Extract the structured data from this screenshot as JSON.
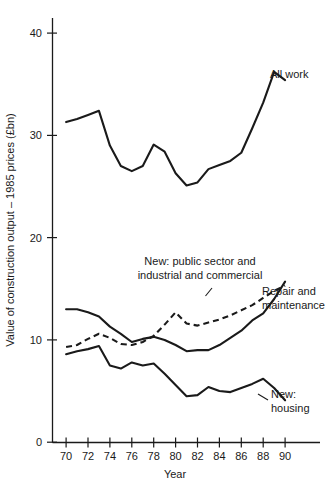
{
  "chart_data": {
    "type": "line",
    "title": "",
    "xlabel": "Year",
    "ylabel": "Value of construction output – 1985 prices (£bn)",
    "xlim": [
      69.2,
      91.0
    ],
    "ylim": [
      0,
      41.5
    ],
    "grid": false,
    "legend_position": "inline-annotations",
    "x_ticks": [
      70,
      72,
      74,
      76,
      78,
      80,
      82,
      84,
      86,
      88,
      90
    ],
    "x_tick_labels": [
      "70",
      "72",
      "74",
      "76",
      "78",
      "80",
      "82",
      "84",
      "86",
      "88",
      "90"
    ],
    "y_ticks": [
      0,
      10,
      20,
      30,
      40
    ],
    "y_tick_labels": [
      "0",
      "10",
      "20",
      "30",
      "40"
    ],
    "x": [
      70,
      71,
      72,
      73,
      74,
      75,
      76,
      77,
      78,
      79,
      80,
      81,
      82,
      83,
      84,
      85,
      86,
      87,
      88,
      89,
      90
    ],
    "series": [
      {
        "name": "All work",
        "style": "solid",
        "label": "All work",
        "values": [
          31.3,
          31.6,
          32.0,
          32.4,
          29.0,
          27.0,
          26.5,
          27.0,
          29.1,
          28.4,
          26.3,
          25.1,
          25.4,
          26.7,
          27.1,
          27.5,
          28.3,
          30.7,
          33.2,
          36.2,
          35.4
        ]
      },
      {
        "name": "Repair and maintenance",
        "style": "solid",
        "label": "Repair and\nmaintenance",
        "label_line1": "Repair and",
        "label_line2": "maintenance",
        "values": [
          13.0,
          13.0,
          12.7,
          12.3,
          11.3,
          10.6,
          9.8,
          10.1,
          10.3,
          10.0,
          9.5,
          8.9,
          9.0,
          9.0,
          9.5,
          10.2,
          10.9,
          11.9,
          12.6,
          14.0,
          15.7
        ]
      },
      {
        "name": "New: public sector and industrial and commercial",
        "style": "dashed",
        "label": "New: public sector and\nindustrial and commercial",
        "label_line1": "New: public sector and",
        "label_line2": "industrial and commercial",
        "values": [
          9.3,
          9.5,
          10.1,
          10.6,
          10.2,
          9.6,
          9.5,
          9.8,
          10.4,
          11.5,
          12.7,
          11.6,
          11.4,
          11.7,
          12.0,
          12.4,
          12.9,
          13.4,
          14.1,
          14.8,
          15.3
        ]
      },
      {
        "name": "New: housing",
        "style": "solid",
        "label": "New:\nhousing",
        "label_line1": "New:",
        "label_line2": "housing",
        "values": [
          8.6,
          8.9,
          9.1,
          9.4,
          7.5,
          7.2,
          7.8,
          7.5,
          7.7,
          6.7,
          5.6,
          4.5,
          4.6,
          5.4,
          5.0,
          4.9,
          5.3,
          5.7,
          6.2,
          5.3,
          4.1
        ]
      }
    ],
    "annotations": [
      {
        "id": "all-work",
        "text": "All work"
      },
      {
        "id": "new-public-industrial",
        "text": "New: public sector and industrial and commercial"
      },
      {
        "id": "repair-maintenance",
        "text": "Repair and maintenance"
      },
      {
        "id": "new-housing",
        "text": "New: housing"
      }
    ],
    "colors": {
      "line": "#1a1a1a",
      "axis": "#1a1a1a",
      "background": "#ffffff"
    }
  }
}
